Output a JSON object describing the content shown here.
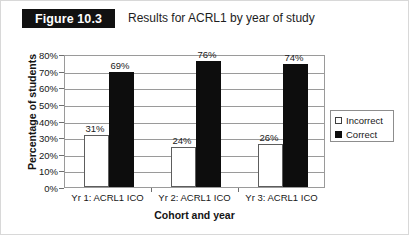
{
  "figure": {
    "badge_label": "Figure 10.3",
    "title": "Results for ACRL1 by year of study"
  },
  "legend": {
    "items": [
      {
        "label": "Incorrect",
        "swatch": "hollow-square"
      },
      {
        "label": "Correct",
        "swatch": "filled-square"
      }
    ]
  },
  "chart_data": {
    "type": "bar",
    "title": "Results for ACRL1 by year of study",
    "xlabel": "Cohort and year",
    "ylabel": "Percentage of students",
    "categories": [
      "Yr 1: ACRL1 ICO",
      "Yr 2: ACRL1 ICO",
      "Yr 3: ACRL1 ICO"
    ],
    "series": [
      {
        "name": "Incorrect",
        "values": [
          31,
          24,
          26
        ],
        "color": "#ffffff"
      },
      {
        "name": "Correct",
        "values": [
          69,
          76,
          74
        ],
        "color": "#0d0d0d"
      }
    ],
    "value_labels": [
      "31%",
      "69%",
      "24%",
      "76%",
      "26%",
      "74%"
    ],
    "ylim": [
      0,
      80
    ],
    "ytick_labels": [
      "80%",
      "70%",
      "60%",
      "50%",
      "40%",
      "30%",
      "20%",
      "10%",
      "0%"
    ],
    "ytick_values": [
      80,
      70,
      60,
      50,
      40,
      30,
      20,
      10,
      0
    ],
    "grid": true,
    "legend_position": "right"
  }
}
